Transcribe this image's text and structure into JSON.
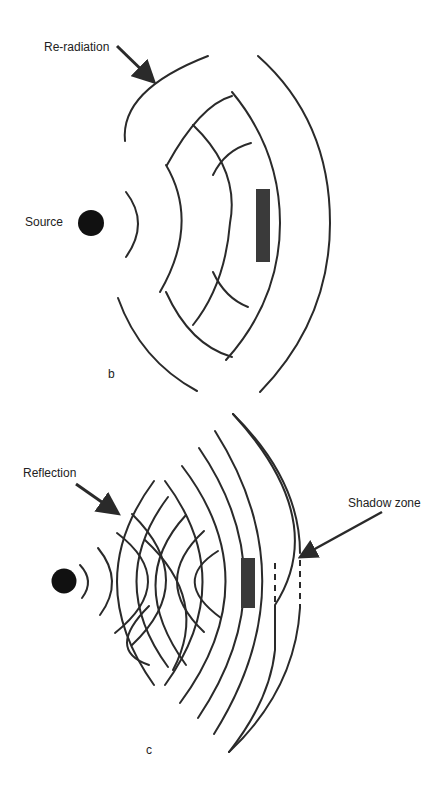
{
  "panel_b": {
    "label_re_radiation": "Re-radiation",
    "label_source": "Source",
    "panel_letter": "b"
  },
  "panel_c": {
    "label_reflection": "Reflection",
    "label_shadow_zone": "Shadow zone",
    "panel_letter": "c"
  },
  "colors": {
    "ink": "#2a2a2a",
    "obstacle": "#3a3a3a",
    "source": "#111111"
  }
}
